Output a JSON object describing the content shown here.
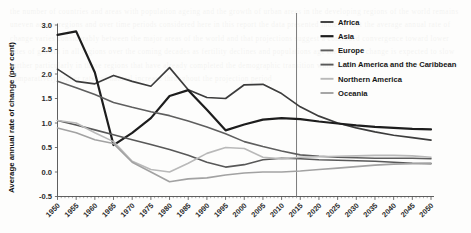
{
  "chart_data": {
    "type": "line",
    "title": "",
    "xlabel": "",
    "ylabel": "Average annual rate of change (per cent)",
    "xlim": [
      1950,
      2050
    ],
    "ylim": [
      -0.5,
      3.0
    ],
    "ytick_step": 0.5,
    "xtick_step": 5,
    "grid": false,
    "legend_position": "top-right",
    "x": [
      1950,
      1955,
      1960,
      1965,
      1970,
      1975,
      1980,
      1985,
      1990,
      1995,
      2000,
      2005,
      2010,
      2015,
      2020,
      2025,
      2030,
      2035,
      2040,
      2045,
      2050
    ],
    "ytick_labels": [
      "3.0",
      "2.5",
      "2.0",
      "1.5",
      "1.0",
      "0.5",
      "0.0",
      "-0.5"
    ],
    "ytick_values": [
      3.0,
      2.5,
      2.0,
      1.5,
      1.0,
      0.5,
      0.0,
      -0.5
    ],
    "xtick_labels": [
      "1950",
      "1955",
      "1960",
      "1965",
      "1970",
      "1975",
      "1980",
      "1985",
      "1990",
      "1995",
      "2000",
      "2005",
      "2010",
      "2015",
      "2020",
      "2025",
      "2030",
      "2035",
      "2040",
      "2045",
      "2050"
    ],
    "reference_line": {
      "x": 2014,
      "label": ""
    },
    "series": [
      {
        "name": "Africa",
        "color": "#3c3c3c",
        "width": 1.7,
        "values": [
          2.1,
          1.85,
          1.8,
          1.97,
          1.85,
          1.75,
          2.13,
          1.68,
          1.52,
          1.5,
          1.78,
          1.79,
          1.6,
          1.33,
          1.14,
          1.0,
          0.9,
          0.82,
          0.75,
          0.7,
          0.65
        ]
      },
      {
        "name": "Asia",
        "color": "#1d1d1d",
        "width": 2.2,
        "values": [
          2.8,
          2.87,
          2.03,
          0.55,
          0.8,
          1.1,
          1.55,
          1.67,
          1.27,
          0.85,
          0.97,
          1.07,
          1.1,
          1.08,
          1.03,
          0.99,
          0.95,
          0.92,
          0.9,
          0.88,
          0.87
        ]
      },
      {
        "name": "Europe",
        "color": "#5e5e5e",
        "width": 1.6,
        "values": [
          1.85,
          1.72,
          1.58,
          1.42,
          1.32,
          1.23,
          1.15,
          1.04,
          0.92,
          0.78,
          0.62,
          0.52,
          0.43,
          0.35,
          0.32,
          0.3,
          0.29,
          0.28,
          0.28,
          0.28,
          0.27
        ]
      },
      {
        "name": "Latin America and the Caribbean",
        "color": "#585858",
        "width": 1.6,
        "values": [
          1.05,
          0.96,
          0.86,
          0.76,
          0.66,
          0.56,
          0.46,
          0.34,
          0.2,
          0.1,
          0.15,
          0.25,
          0.28,
          0.27,
          0.25,
          0.24,
          0.23,
          0.22,
          0.2,
          0.18,
          0.17
        ]
      },
      {
        "name": "Northern America",
        "color": "#b9b9b9",
        "width": 1.6,
        "values": [
          1.05,
          1.0,
          0.8,
          0.62,
          0.22,
          0.05,
          0.0,
          0.18,
          0.38,
          0.5,
          0.48,
          0.3,
          0.27,
          0.3,
          0.31,
          0.32,
          0.33,
          0.34,
          0.34,
          0.33,
          0.3
        ]
      },
      {
        "name": "Oceania",
        "color": "#a2a2a2",
        "width": 1.6,
        "values": [
          0.9,
          0.8,
          0.66,
          0.58,
          0.2,
          0.0,
          -0.2,
          -0.14,
          -0.12,
          -0.06,
          -0.02,
          0.0,
          0.0,
          0.02,
          0.05,
          0.08,
          0.11,
          0.14,
          0.16,
          0.17,
          0.18
        ]
      }
    ]
  },
  "legend": {
    "items": [
      {
        "label": "Africa"
      },
      {
        "label": "Asia"
      },
      {
        "label": "Europe"
      },
      {
        "label": "Latin America and the Caribbean"
      },
      {
        "label": "Northern America"
      },
      {
        "label": "Oceania"
      }
    ]
  },
  "background": {
    "bleed_text": "the number of countries and areas with population ageing and the growth of urban areas in the developing regions of the world remains uneven across regions and over time periods considered here in this report the data presented indicate that the average annual rate of change varies considerably between the major areas of the world and that projections suggest a continued convergence toward lower rates of growth in all regions over the coming decades as fertility declines and populations age the pace of change is expected to slow further particularly in those regions that have already completed the demographic transition while other regions continue to experience comparatively higher rates of natural increase throughout the projection period"
  }
}
